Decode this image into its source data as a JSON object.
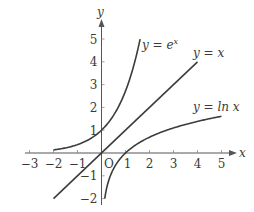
{
  "chart_data": {
    "type": "line",
    "title": "",
    "xlabel": "x",
    "ylabel": "y",
    "origin_label": "O",
    "xlim": [
      -3,
      5
    ],
    "ylim": [
      -2,
      5
    ],
    "x_ticks": [
      -3,
      -2,
      -1,
      1,
      2,
      3,
      4,
      5
    ],
    "y_ticks": [
      -2,
      -1,
      1,
      2,
      3,
      4,
      5
    ],
    "grid": false,
    "series": [
      {
        "name": "y = e^x",
        "label_main": "y = e",
        "label_sup": "x",
        "domain": [
          -2,
          1.609
        ],
        "points": [
          [
            -2,
            0.135
          ],
          [
            -1,
            0.368
          ],
          [
            0,
            1
          ],
          [
            0.5,
            1.649
          ],
          [
            1,
            2.718
          ],
          [
            1.5,
            4.482
          ],
          [
            1.609,
            5
          ]
        ]
      },
      {
        "name": "y = x",
        "label_main": "y = x",
        "domain": [
          -2,
          4
        ],
        "points": [
          [
            -2,
            -2
          ],
          [
            0,
            0
          ],
          [
            4,
            4
          ]
        ]
      },
      {
        "name": "y = ln x",
        "label_main": "y = ln x",
        "domain": [
          0.135,
          5
        ],
        "points": [
          [
            0.135,
            -2
          ],
          [
            0.368,
            -1
          ],
          [
            1,
            0
          ],
          [
            2,
            0.693
          ],
          [
            3,
            1.099
          ],
          [
            4,
            1.386
          ],
          [
            5,
            1.609
          ]
        ]
      }
    ],
    "colors": {
      "curve": "#3c3c3c",
      "axis": "#555555",
      "text": "#3a3a3a"
    }
  }
}
